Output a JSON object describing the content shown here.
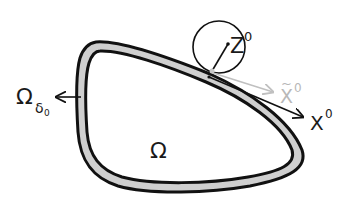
{
  "diagram": {
    "type": "domain-boundary-illustration",
    "colors": {
      "outline": "#111111",
      "band_fill": "#cfcfcf",
      "background": "#ffffff",
      "projection_arrow": "#c0c0c0",
      "main_arrow": "#111111"
    },
    "labels": {
      "domain": "Ω",
      "band_main": "Ω",
      "band_sub": "δ",
      "band_subsub": "0",
      "z_point": "Z",
      "z_sup": "0",
      "x_tilde": "X",
      "x_tilde_mark": "~",
      "x_tilde_sup": "0",
      "x_point": "X",
      "x_sup": "0"
    }
  }
}
